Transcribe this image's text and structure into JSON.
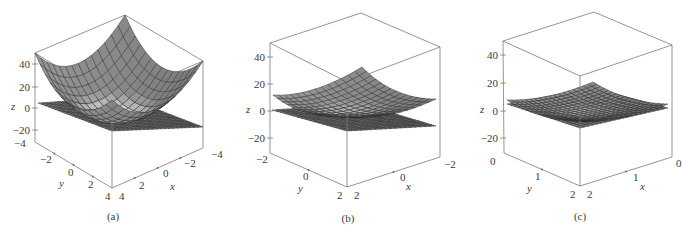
{
  "figure": {
    "panels": [
      "(a)",
      "(b)",
      "(c)"
    ]
  },
  "chart_data": [
    {
      "type": "surface3d",
      "caption": "(a)",
      "title": "",
      "xlabel": "x",
      "ylabel": "y",
      "zlabel": "z",
      "x_range": [
        -4,
        4
      ],
      "y_range": [
        -4,
        4
      ],
      "z_range": [
        -30,
        50
      ],
      "x_ticks": [
        "-4",
        "-2",
        "0",
        "2",
        "4"
      ],
      "y_ticks": [
        "-4",
        "-2",
        "0",
        "2",
        "4"
      ],
      "z_ticks": [
        "40",
        "20",
        "0",
        "-20"
      ],
      "surfaces": [
        {
          "name": "paraboloid",
          "description": "z = x^2 + y^2 + ... upward opening paraboloid, min near 0 at origin, ~50 at corners",
          "shade": "#8a8a8a"
        },
        {
          "name": "tangent plane",
          "description": "near-flat plane at z ≈ 0",
          "shade": "#7a7a7a"
        }
      ]
    },
    {
      "type": "surface3d",
      "caption": "(b)",
      "title": "",
      "xlabel": "x",
      "ylabel": "y",
      "zlabel": "z",
      "x_range": [
        -2,
        2
      ],
      "y_range": [
        -2,
        2
      ],
      "z_range": [
        -30,
        50
      ],
      "x_ticks": [
        "-2",
        "0",
        "2"
      ],
      "y_ticks": [
        "-2",
        "0",
        "2"
      ],
      "z_ticks": [
        "40",
        "20",
        "0",
        "-20"
      ],
      "surfaces": [
        {
          "name": "paraboloid",
          "description": "zoomed view; surface closer to plane, ~15 at far corner",
          "shade": "#858585"
        },
        {
          "name": "tangent plane",
          "description": "near-flat plane at z ≈ 0",
          "shade": "#7a7a7a"
        }
      ]
    },
    {
      "type": "surface3d",
      "caption": "(c)",
      "title": "",
      "xlabel": "x",
      "ylabel": "y",
      "zlabel": "z",
      "x_range": [
        0,
        2
      ],
      "y_range": [
        0,
        2
      ],
      "z_range": [
        -30,
        50
      ],
      "x_ticks": [
        "0",
        "1",
        "2"
      ],
      "y_ticks": [
        "0",
        "1",
        "2"
      ],
      "z_ticks": [
        "40",
        "20",
        "0",
        "-20"
      ],
      "surfaces": [
        {
          "name": "paraboloid",
          "description": "further zoomed; nearly coincident with plane",
          "shade": "#838383"
        },
        {
          "name": "tangent plane",
          "description": "near-flat plane",
          "shade": "#7a7a7a"
        }
      ]
    }
  ],
  "layout": {
    "panels": [
      {
        "box": {
          "apex": [
            125,
            15
          ],
          "left_top": [
            35,
            53
          ],
          "right_top": [
            203,
            61
          ],
          "front_top": [
            112,
            100
          ],
          "left_bot": [
            35,
            142
          ],
          "right_bot": [
            203,
            148
          ],
          "front_bot": [
            112,
            188
          ]
        },
        "zt": [
          [
            40,
            64
          ],
          [
            20,
            87
          ],
          [
            0,
            108
          ],
          [
            -20,
            130
          ]
        ],
        "zlabel_pos": [
          11,
          110
        ],
        "y_tick_labels": [
          [
            "-4",
            14,
            147
          ],
          [
            "-2",
            40,
            163
          ],
          [
            "0",
            68,
            176
          ],
          [
            "2",
            88,
            188
          ],
          [
            "4",
            105,
            200
          ]
        ],
        "x_tick_labels": [
          [
            "4",
            119,
            200
          ],
          [
            "2",
            139,
            189
          ],
          [
            "0",
            163,
            177
          ],
          [
            "-2",
            184,
            167
          ],
          [
            "-4",
            211,
            158
          ]
        ],
        "ylabel_pos": [
          59,
          187
        ],
        "xlabel_pos": [
          170,
          190
        ],
        "caption_pos": [
          113,
          220
        ],
        "surf": {
          "kind": "bowl",
          "back": [
            125,
            15
          ],
          "left": [
            35,
            53
          ],
          "right": [
            203,
            61
          ],
          "front": [
            112,
            100
          ],
          "center": [
            115,
            116
          ],
          "n": 14
        },
        "plane": {
          "back": [
            125,
            97
          ],
          "left": [
            38,
            103
          ],
          "right": [
            203,
            127
          ],
          "front": [
            112,
            131
          ],
          "n": 22
        }
      },
      {
        "box": {
          "apex": [
            361,
            13
          ],
          "left_top": [
            270,
            43
          ],
          "right_top": [
            440,
            47
          ],
          "front_top": [
            347,
            82
          ],
          "left_bot": [
            270,
            153
          ],
          "right_bot": [
            440,
            157
          ],
          "front_bot": [
            347,
            187
          ]
        },
        "zt": [
          [
            40,
            57
          ],
          [
            20,
            84
          ],
          [
            0,
            111
          ],
          [
            -20,
            138
          ]
        ],
        "zlabel_pos": [
          246,
          113
        ],
        "y_tick_labels": [
          [
            "-2",
            256,
            163
          ],
          [
            "0",
            303,
            180
          ],
          [
            "2",
            337,
            199
          ]
        ],
        "x_tick_labels": [
          [
            "2",
            354,
            199
          ],
          [
            "0",
            400,
            181
          ],
          [
            "-2",
            444,
            168
          ]
        ],
        "ylabel_pos": [
          298,
          192
        ],
        "xlabel_pos": [
          406,
          190
        ],
        "caption_pos": [
          348,
          222
        ],
        "surf": {
          "kind": "bowl",
          "back": [
            362,
            67
          ],
          "left": [
            273,
            95
          ],
          "right": [
            436,
            99
          ],
          "front": [
            347,
            114
          ],
          "center": [
            349,
            110
          ],
          "n": 14
        },
        "plane": {
          "back": [
            362,
            104
          ],
          "left": [
            272,
            110
          ],
          "right": [
            436,
            126
          ],
          "front": [
            347,
            131
          ],
          "n": 18
        }
      },
      {
        "box": {
          "apex": [
            594,
            12
          ],
          "left_top": [
            503,
            41
          ],
          "right_top": [
            672,
            45
          ],
          "front_top": [
            580,
            76
          ],
          "left_bot": [
            504,
            153
          ],
          "right_bot": [
            672,
            157
          ],
          "front_bot": [
            580,
            186
          ]
        },
        "zt": [
          [
            40,
            55
          ],
          [
            20,
            83
          ],
          [
            0,
            111
          ],
          [
            -20,
            138
          ]
        ],
        "zlabel_pos": [
          480,
          113
        ],
        "y_tick_labels": [
          [
            "0",
            490,
            165
          ],
          [
            "1",
            535,
            180
          ],
          [
            "2",
            570,
            198
          ]
        ],
        "x_tick_labels": [
          [
            "2",
            587,
            198
          ],
          [
            "1",
            633,
            181
          ],
          [
            "0",
            676,
            167
          ]
        ],
        "ylabel_pos": [
          527,
          192
        ],
        "xlabel_pos": [
          640,
          190
        ],
        "caption_pos": [
          580,
          220
        ],
        "surf": {
          "kind": "bowl",
          "back": [
            593,
            82
          ],
          "left": [
            507,
            100
          ],
          "right": [
            668,
            104
          ],
          "front": [
            580,
            121
          ],
          "center": [
            584,
            112
          ],
          "n": 18
        },
        "plane": {
          "back": [
            593,
            88
          ],
          "left": [
            507,
            104
          ],
          "right": [
            668,
            108
          ],
          "front": [
            580,
            128
          ],
          "n": 20
        }
      }
    ]
  }
}
